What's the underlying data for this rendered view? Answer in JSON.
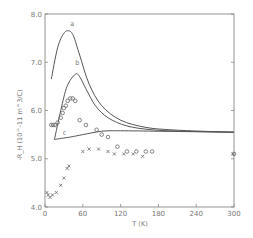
{
  "chart_data": {
    "type": "line",
    "title": "",
    "xlabel": "T (K)",
    "ylabel": "-R_H (10^-11 m^3/C)",
    "xlim": [
      0,
      300
    ],
    "ylim": [
      4.0,
      8.0
    ],
    "x_ticks": [
      "0",
      "60",
      "120",
      "180",
      "240",
      "300"
    ],
    "y_ticks": [
      "4.0",
      "5.0",
      "6.0",
      "7.0",
      "8.0"
    ],
    "grid": false,
    "legend": null,
    "curve_labels": [
      "a",
      "b",
      "c"
    ],
    "series": [
      {
        "name": "a",
        "kind": "line",
        "x": [
          10,
          20,
          30,
          38,
          45,
          55,
          70,
          90,
          120,
          160,
          200,
          250,
          300
        ],
        "y": [
          6.65,
          7.3,
          7.6,
          7.65,
          7.55,
          7.15,
          6.55,
          6.1,
          5.8,
          5.65,
          5.6,
          5.57,
          5.55
        ]
      },
      {
        "name": "b",
        "kind": "line",
        "x": [
          15,
          25,
          35,
          48,
          55,
          65,
          80,
          100,
          130,
          170,
          220,
          300
        ],
        "y": [
          5.4,
          6.0,
          6.5,
          6.75,
          6.7,
          6.45,
          6.1,
          5.85,
          5.68,
          5.6,
          5.57,
          5.55
        ]
      },
      {
        "name": "c",
        "kind": "line",
        "x": [
          15,
          40,
          60,
          90,
          120,
          180,
          240,
          300
        ],
        "y": [
          5.4,
          5.45,
          5.5,
          5.57,
          5.58,
          5.57,
          5.56,
          5.55
        ]
      },
      {
        "name": "circles",
        "kind": "scatter",
        "marker": "o",
        "x": [
          10,
          13,
          16,
          20,
          25,
          28,
          30,
          33,
          36,
          40,
          44,
          48,
          55,
          65,
          82,
          90,
          100,
          115,
          130,
          145,
          160,
          170,
          300
        ],
        "y": [
          5.7,
          5.7,
          5.7,
          5.75,
          5.85,
          5.95,
          6.05,
          6.1,
          6.2,
          6.25,
          6.25,
          6.2,
          5.8,
          5.7,
          5.6,
          5.5,
          5.45,
          5.25,
          5.15,
          5.15,
          5.15,
          5.15,
          5.1
        ]
      },
      {
        "name": "crosses",
        "kind": "scatter",
        "marker": "x",
        "x": [
          3,
          5,
          8,
          12,
          18,
          25,
          30,
          35,
          38,
          60,
          70,
          85,
          100,
          110,
          125,
          140,
          155,
          298
        ],
        "y": [
          4.3,
          4.25,
          4.2,
          4.25,
          4.3,
          4.45,
          4.6,
          4.8,
          4.85,
          5.15,
          5.2,
          5.2,
          5.15,
          5.1,
          5.1,
          5.1,
          5.05,
          5.1
        ]
      }
    ]
  }
}
